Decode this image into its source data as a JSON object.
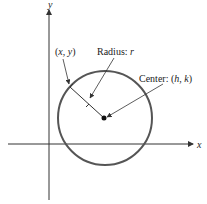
{
  "diagram": {
    "type": "circle-standard-form",
    "axes": {
      "x_label": "x",
      "y_label": "y"
    },
    "labels": {
      "point": "(x, y)",
      "point_parts": {
        "open": "(",
        "x": "x",
        "sep": ", ",
        "y": "y",
        "close": ")"
      },
      "radius": "Radius: r",
      "radius_parts": {
        "prefix": "Radius: ",
        "var": "r"
      },
      "center": "Center: (h, k)",
      "center_parts": {
        "prefix": "Center: (",
        "h": "h",
        "sep": ", ",
        "k": "k",
        "close": ")"
      }
    },
    "colors": {
      "axis": "#333333",
      "circle": "#555555",
      "text": "#222222"
    }
  }
}
